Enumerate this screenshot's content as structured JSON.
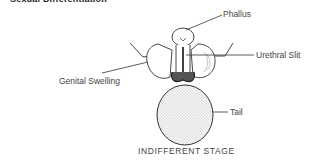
{
  "heading": "Sexual Differentiation",
  "labels": {
    "phallus": "Phallus",
    "urethral_slit": "Urethral Slit",
    "genital_swelling": "Genital Swelling",
    "tail": "Tail"
  },
  "caption": "INDIFFERENT STAGE"
}
